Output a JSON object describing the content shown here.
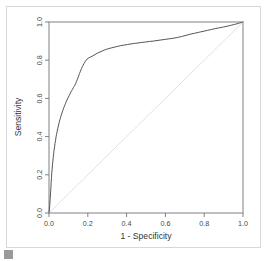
{
  "figure": {
    "background_color": "#ffffff",
    "frame_color": "#d8d8d8",
    "handle_color": "#9a9a9a"
  },
  "chart_data": {
    "type": "line",
    "title": "",
    "subtitle": "",
    "xlabel": "1 - Specificity",
    "ylabel": "Sensitivity",
    "xlim": [
      0.0,
      1.0
    ],
    "ylim": [
      0.0,
      1.0
    ],
    "grid": false,
    "legend": "none",
    "axis_color": "#808080",
    "xticks": [
      "0.0",
      "0.2",
      "0.4",
      "0.6",
      "0.8",
      "1.0"
    ],
    "xtick_values": [
      0.0,
      0.2,
      0.4,
      0.6,
      0.8,
      1.0
    ],
    "yticks": [
      "0.0",
      "0.2",
      "0.4",
      "0.6",
      "0.8",
      "1.0"
    ],
    "ytick_values": [
      0.0,
      0.2,
      0.4,
      0.6,
      0.8,
      1.0
    ],
    "ytick_rotation_deg": 90,
    "series": [
      {
        "name": "ROC curve",
        "color": "#555555",
        "width": 1.0,
        "x": [
          0.0,
          0.004,
          0.006,
          0.008,
          0.01,
          0.011,
          0.013,
          0.014,
          0.016,
          0.018,
          0.02,
          0.022,
          0.024,
          0.026,
          0.029,
          0.031,
          0.034,
          0.036,
          0.039,
          0.042,
          0.045,
          0.048,
          0.051,
          0.054,
          0.058,
          0.061,
          0.065,
          0.069,
          0.073,
          0.077,
          0.081,
          0.086,
          0.09,
          0.095,
          0.1,
          0.105,
          0.11,
          0.115,
          0.121,
          0.126,
          0.132,
          0.137,
          0.141,
          0.145,
          0.149,
          0.153,
          0.157,
          0.162,
          0.167,
          0.173,
          0.18,
          0.188,
          0.196,
          0.205,
          0.215,
          0.226,
          0.238,
          0.25,
          0.263,
          0.276,
          0.29,
          0.305,
          0.32,
          0.336,
          0.352,
          0.369,
          0.386,
          0.404,
          0.422,
          0.44,
          0.459,
          0.478,
          0.497,
          0.517,
          0.537,
          0.557,
          0.578,
          0.599,
          0.62,
          0.641,
          0.662,
          0.684,
          0.706,
          0.728,
          0.75,
          0.772,
          0.794,
          0.816,
          0.838,
          0.86,
          0.88,
          0.9,
          0.918,
          0.935,
          0.95,
          0.963,
          0.974,
          0.983,
          0.991,
          0.996,
          1.0
        ],
        "y": [
          0.0,
          0.04,
          0.075,
          0.105,
          0.135,
          0.16,
          0.185,
          0.208,
          0.23,
          0.252,
          0.272,
          0.292,
          0.311,
          0.329,
          0.347,
          0.364,
          0.381,
          0.397,
          0.412,
          0.427,
          0.441,
          0.455,
          0.468,
          0.481,
          0.494,
          0.506,
          0.518,
          0.53,
          0.542,
          0.553,
          0.564,
          0.575,
          0.586,
          0.597,
          0.607,
          0.617,
          0.627,
          0.637,
          0.647,
          0.657,
          0.667,
          0.677,
          0.687,
          0.697,
          0.707,
          0.718,
          0.73,
          0.742,
          0.755,
          0.768,
          0.782,
          0.795,
          0.806,
          0.812,
          0.817,
          0.823,
          0.83,
          0.837,
          0.843,
          0.849,
          0.855,
          0.86,
          0.864,
          0.868,
          0.872,
          0.876,
          0.879,
          0.882,
          0.885,
          0.888,
          0.89,
          0.893,
          0.895,
          0.898,
          0.9,
          0.903,
          0.906,
          0.909,
          0.912,
          0.915,
          0.919,
          0.924,
          0.93,
          0.936,
          0.941,
          0.946,
          0.951,
          0.956,
          0.961,
          0.966,
          0.97,
          0.974,
          0.978,
          0.982,
          0.986,
          0.989,
          0.992,
          0.995,
          0.997,
          0.999,
          1.0
        ]
      },
      {
        "name": "Chance diagonal",
        "color": "#e2e2e2",
        "width": 1.0,
        "x": [
          0.0,
          1.0
        ],
        "y": [
          0.0,
          1.0
        ]
      }
    ]
  }
}
